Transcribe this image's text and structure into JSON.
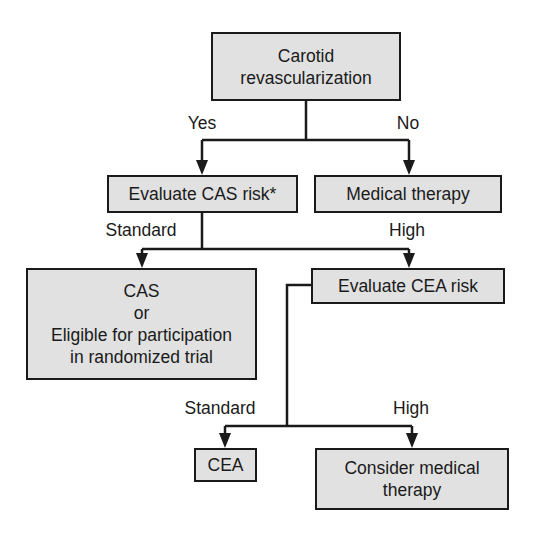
{
  "diagram": {
    "type": "flowchart",
    "colors": {
      "box_fill": "#e1e1e1",
      "box_border": "#1a1a1a",
      "line": "#1a1a1a",
      "background": "#ffffff"
    },
    "nodes": {
      "root": {
        "lines": [
          "Carotid",
          "revascularization"
        ]
      },
      "evaluate_cas": {
        "lines": [
          "Evaluate CAS risk*"
        ]
      },
      "medical_therapy": {
        "lines": [
          "Medical therapy"
        ]
      },
      "cas_or_trial": {
        "lines": [
          "CAS",
          "or",
          "Eligible for participation",
          "in randomized trial"
        ]
      },
      "evaluate_cea": {
        "lines": [
          "Evaluate CEA risk"
        ]
      },
      "cea": {
        "lines": [
          "CEA"
        ]
      },
      "consider_medical": {
        "lines": [
          "Consider medical",
          "therapy"
        ]
      }
    },
    "edge_labels": {
      "yes": "Yes",
      "no": "No",
      "cas_standard": "Standard",
      "cas_high": "High",
      "cea_standard": "Standard",
      "cea_high": "High"
    },
    "edges": [
      {
        "from": "root",
        "to": "evaluate_cas",
        "label": "Yes"
      },
      {
        "from": "root",
        "to": "medical_therapy",
        "label": "No"
      },
      {
        "from": "evaluate_cas",
        "to": "cas_or_trial",
        "label": "Standard"
      },
      {
        "from": "evaluate_cas",
        "to": "evaluate_cea",
        "label": "High"
      },
      {
        "from": "evaluate_cea",
        "to": "cea",
        "label": "Standard"
      },
      {
        "from": "evaluate_cea",
        "to": "consider_medical",
        "label": "High"
      }
    ]
  }
}
